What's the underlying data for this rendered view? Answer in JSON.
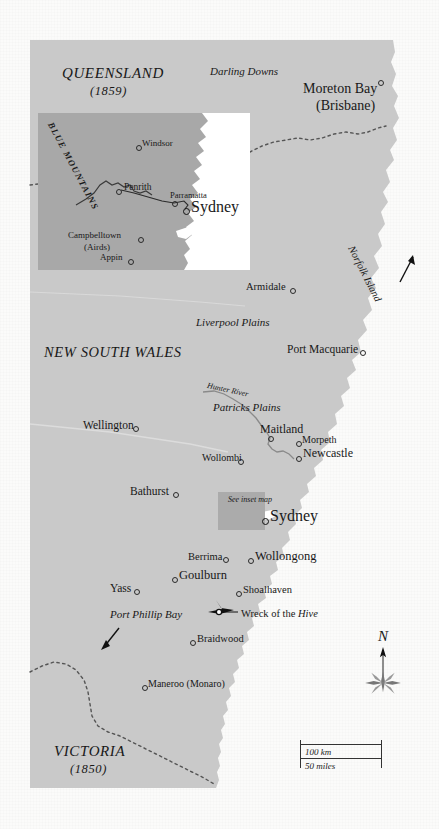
{
  "map": {
    "title_context": "Historical map of New South Wales and neighbouring colonies",
    "colors": {
      "land": "#c9c9c9",
      "sea": "#ffffff",
      "paper": "#fbfbfa",
      "inset_land": "#a8a8a8",
      "highlight": "#ababab",
      "ink": "#181818",
      "border_dash": "#555555"
    }
  },
  "regions": [
    {
      "name": "queensland",
      "label": "QUEENSLAND",
      "year": "(1859)"
    },
    {
      "name": "new-south-wales",
      "label": "NEW SOUTH WALES",
      "year": ""
    },
    {
      "name": "victoria",
      "label": "VICTORIA",
      "year": "(1850)"
    }
  ],
  "areas": [
    {
      "name": "darling-downs",
      "label": "Darling Downs"
    },
    {
      "name": "liverpool-plains",
      "label": "Liverpool Plains"
    },
    {
      "name": "patricks-plains",
      "label": "Patricks Plains"
    },
    {
      "name": "hunter-river",
      "label": "Hunter River"
    }
  ],
  "settlements": [
    {
      "name": "moreton-bay",
      "label": "Moreton Bay",
      "sub": "(Brisbane)"
    },
    {
      "name": "armidale",
      "label": "Armidale"
    },
    {
      "name": "port-macquarie",
      "label": "Port Macquarie"
    },
    {
      "name": "maitland",
      "label": "Maitland"
    },
    {
      "name": "morpeth",
      "label": "Morpeth"
    },
    {
      "name": "newcastle",
      "label": "Newcastle"
    },
    {
      "name": "wollombi",
      "label": "Wollombi"
    },
    {
      "name": "wellington",
      "label": "Wellington"
    },
    {
      "name": "bathurst",
      "label": "Bathurst"
    },
    {
      "name": "sydney",
      "label": "Sydney"
    },
    {
      "name": "wollongong",
      "label": "Wollongong"
    },
    {
      "name": "berrima",
      "label": "Berrima"
    },
    {
      "name": "goulburn",
      "label": "Goulburn"
    },
    {
      "name": "yass",
      "label": "Yass"
    },
    {
      "name": "shoalhaven",
      "label": "Shoalhaven"
    },
    {
      "name": "braidwood",
      "label": "Braidwood"
    },
    {
      "name": "maneroo",
      "label": "Maneroo (Monaro)"
    }
  ],
  "annotations": {
    "wreck": "Wreck of the",
    "wreck_ship": "Hive",
    "norfolk_island": "Norfolk Island",
    "port_phillip_bay": "Port Phillip Bay",
    "see_inset": "See inset map"
  },
  "inset": {
    "mountains": "BLUE MOUNTAINS",
    "places": [
      {
        "name": "windsor",
        "label": "Windsor"
      },
      {
        "name": "penrith",
        "label": "Penrith"
      },
      {
        "name": "parramatta",
        "label": "Parramatta"
      },
      {
        "name": "sydney",
        "label": "Sydney"
      },
      {
        "name": "campbelltown",
        "label": "Campbelltown"
      },
      {
        "name": "airds",
        "label": "(Airds)"
      },
      {
        "name": "appin",
        "label": "Appin"
      }
    ]
  },
  "compass": {
    "north": "N"
  },
  "scale": {
    "km": "100 km",
    "miles": "50 miles"
  }
}
